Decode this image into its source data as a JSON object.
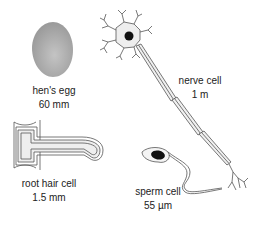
{
  "figure": {
    "items": [
      {
        "id": "hens-egg",
        "name": "hen's egg",
        "size": "60 mm"
      },
      {
        "id": "nerve-cell",
        "name": "nerve cell",
        "size": "1 m"
      },
      {
        "id": "root-hair-cell",
        "name": "root hair cell",
        "size": "1.5 mm"
      },
      {
        "id": "sperm-cell",
        "name": "sperm cell",
        "size": "55 µm"
      }
    ],
    "colors": {
      "egg_fill": "#a8a8a8",
      "outline": "#555555",
      "cell_fill": "#e6e6e6",
      "nucleus": "#111111"
    }
  }
}
